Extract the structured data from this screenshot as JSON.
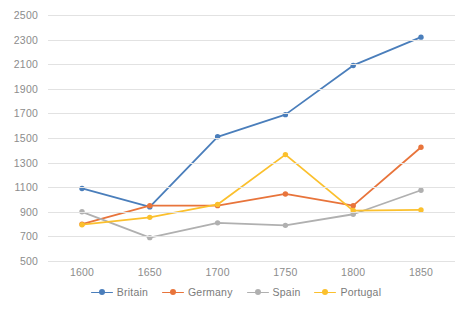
{
  "chart_data": {
    "type": "line",
    "title": "",
    "subtitle": "",
    "xlabel": "",
    "ylabel": "",
    "x": [
      1600,
      1650,
      1700,
      1750,
      1800,
      1850
    ],
    "xtick_labels": [
      "1600",
      "1650",
      "1700",
      "1750",
      "1800",
      "1850"
    ],
    "ytick_labels": [
      "500",
      "700",
      "900",
      "1100",
      "1300",
      "1500",
      "1700",
      "1900",
      "2100",
      "2300",
      "2500"
    ],
    "yticks": [
      500,
      700,
      900,
      1100,
      1300,
      1500,
      1700,
      1900,
      2100,
      2300,
      2500
    ],
    "ylim": [
      500,
      2500
    ],
    "grid": true,
    "legend_position": "bottom",
    "markers": true,
    "series": [
      {
        "name": "Britain",
        "color": "#4a7ebb",
        "values": [
          1090,
          940,
          1510,
          1690,
          2090,
          2320
        ]
      },
      {
        "name": "Germany",
        "color": "#e8743b",
        "values": [
          800,
          950,
          950,
          1045,
          950,
          1425
        ]
      },
      {
        "name": "Spain",
        "color": "#b0b0b0",
        "values": [
          900,
          690,
          810,
          790,
          880,
          1075
        ]
      },
      {
        "name": "Portugal",
        "color": "#fbc02d",
        "values": [
          795,
          855,
          960,
          1365,
          910,
          915
        ]
      }
    ]
  },
  "legend": {
    "items": [
      {
        "label": "Britain"
      },
      {
        "label": "Germany"
      },
      {
        "label": "Spain"
      },
      {
        "label": "Portugal"
      }
    ]
  },
  "colors": {
    "britain": "#4a7ebb",
    "germany": "#e8743b",
    "spain": "#b0b0b0",
    "portugal": "#fbc02d",
    "gridline": "#e2e2e2",
    "tick_text": "#8c8c8c",
    "background": "#ffffff"
  }
}
